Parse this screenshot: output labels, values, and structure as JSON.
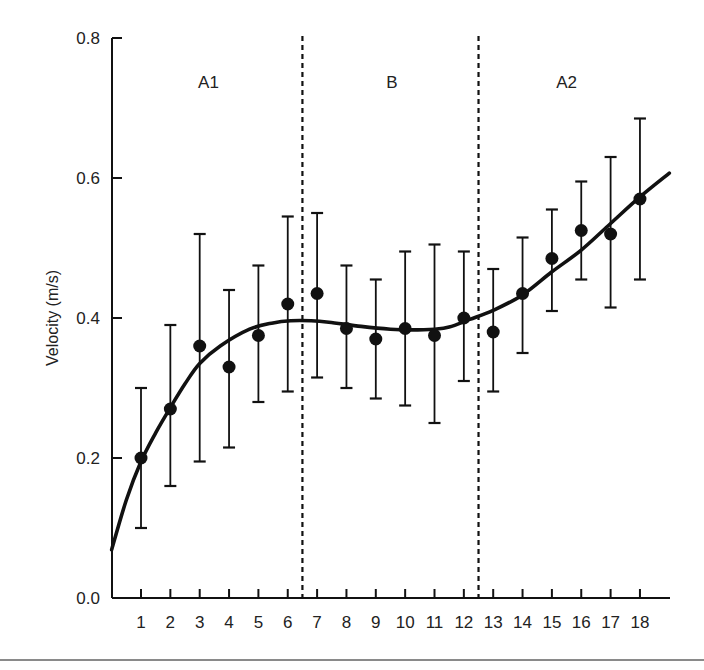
{
  "chart_data": {
    "type": "scatter",
    "title": "",
    "xlabel": "",
    "ylabel": "Velocity (m/s)",
    "xlim": [
      0,
      19
    ],
    "ylim": [
      0.0,
      0.8
    ],
    "grid": false,
    "legend": null,
    "x_ticks": [
      "1",
      "2",
      "3",
      "4",
      "5",
      "6",
      "7",
      "8",
      "9",
      "10",
      "11",
      "12",
      "13",
      "14",
      "15",
      "16",
      "17",
      "18"
    ],
    "y_ticks": [
      "0.0",
      "0.2",
      "0.4",
      "0.6",
      "0.8"
    ],
    "y_tick_values": [
      0.0,
      0.2,
      0.4,
      0.6,
      0.8
    ],
    "regions": [
      {
        "label": "A1",
        "x_center": 3.3
      },
      {
        "label": "B",
        "x_center": 9.55
      },
      {
        "label": "A2",
        "x_center": 15.5
      }
    ],
    "region_dividers": [
      6.5,
      12.5
    ],
    "series": [
      {
        "name": "mean velocity",
        "marker": "filled-circle",
        "x": [
          1,
          2,
          3,
          4,
          5,
          6,
          7,
          8,
          9,
          10,
          11,
          12,
          13,
          14,
          15,
          16,
          17,
          18
        ],
        "values": [
          0.2,
          0.27,
          0.36,
          0.33,
          0.375,
          0.42,
          0.435,
          0.385,
          0.37,
          0.385,
          0.375,
          0.4,
          0.38,
          0.435,
          0.485,
          0.525,
          0.52,
          0.57
        ],
        "error_upper": [
          0.3,
          0.39,
          0.52,
          0.44,
          0.475,
          0.545,
          0.55,
          0.475,
          0.455,
          0.495,
          0.505,
          0.495,
          0.47,
          0.515,
          0.555,
          0.595,
          0.63,
          0.685
        ],
        "error_lower": [
          0.1,
          0.16,
          0.195,
          0.215,
          0.28,
          0.295,
          0.315,
          0.3,
          0.285,
          0.275,
          0.25,
          0.31,
          0.295,
          0.35,
          0.41,
          0.455,
          0.415,
          0.455
        ]
      },
      {
        "name": "fitted curve",
        "type": "line",
        "x": [
          0.0,
          0.5,
          1.0,
          1.5,
          2.0,
          2.5,
          3.0,
          3.7,
          4.7,
          5.5,
          6.1,
          6.8,
          7.4,
          8.5,
          9.5,
          10.2,
          11.0,
          11.5,
          12.2,
          13.0,
          14.0,
          15.0,
          16.0,
          17.0,
          18.0,
          19.0
        ],
        "values": [
          0.069,
          0.14,
          0.195,
          0.236,
          0.272,
          0.306,
          0.335,
          0.36,
          0.384,
          0.393,
          0.396,
          0.396,
          0.394,
          0.388,
          0.384,
          0.383,
          0.384,
          0.387,
          0.398,
          0.411,
          0.433,
          0.466,
          0.497,
          0.535,
          0.573,
          0.607
        ]
      }
    ]
  }
}
